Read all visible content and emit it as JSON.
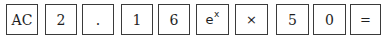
{
  "keypad": {
    "keys": [
      {
        "id": "ac",
        "label": "AC",
        "left": 6,
        "width": 32
      },
      {
        "id": "2",
        "label": "2",
        "left": 45,
        "width": 32
      },
      {
        "id": "decimal",
        "label": ".",
        "left": 82,
        "width": 32
      },
      {
        "id": "1",
        "label": "1",
        "left": 121,
        "width": 32
      },
      {
        "id": "6",
        "label": "6",
        "left": 158,
        "width": 32
      },
      {
        "id": "exp",
        "label": "e",
        "sup": "x",
        "left": 196,
        "width": 33
      },
      {
        "id": "multiply",
        "label": "×",
        "left": 235,
        "width": 33
      },
      {
        "id": "5",
        "label": "5",
        "left": 276,
        "width": 33
      },
      {
        "id": "0",
        "label": "0",
        "left": 313,
        "width": 33
      },
      {
        "id": "equals",
        "label": "=",
        "left": 350,
        "width": 31
      }
    ]
  },
  "colors": {
    "border": "#3a3a3a",
    "text": "#1e1e1e",
    "background": "#ffffff"
  }
}
